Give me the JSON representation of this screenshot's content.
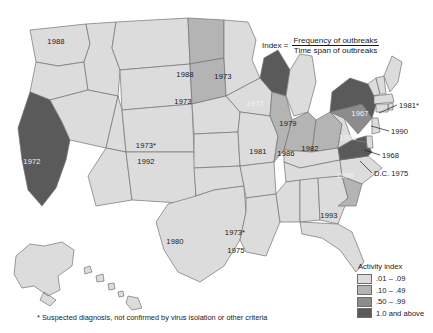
{
  "formula": {
    "label": "Index =",
    "numerator": "Frequency of outbreaks",
    "denominator": "Time span of outbreaks"
  },
  "legend": {
    "title": "Activity index",
    "items": [
      {
        "label": ".01 – .09",
        "color": "#dcdcdc"
      },
      {
        "label": ".10 – .49",
        "color": "#b4b4b4"
      },
      {
        "label": ".50 – .99",
        "color": "#8c8c8c"
      },
      {
        "label": "1.0 and above",
        "color": "#5a5a5a"
      }
    ]
  },
  "footnote": "* Suspected diagnosis, not confirmed by virus isolation or other criteria",
  "state_labels": [
    {
      "state": "washington",
      "text": "1988",
      "x": 56,
      "y": 41,
      "tone": "onlight"
    },
    {
      "state": "california",
      "text": "1972",
      "x": 32,
      "y": 161,
      "tone": "ondark"
    },
    {
      "state": "north-dakota",
      "text": "1988",
      "x": 185,
      "y": 74,
      "tone": "onlight"
    },
    {
      "state": "south-dakota",
      "text": "1973",
      "x": 183,
      "y": 101,
      "tone": "onlight"
    },
    {
      "state": "minnesota",
      "text": "1973",
      "x": 223,
      "y": 76,
      "tone": "onlight"
    },
    {
      "state": "wisconsin",
      "text": "1973",
      "x": 255,
      "y": 103,
      "tone": "ondark"
    },
    {
      "state": "colorado-suspected",
      "text": "1973*",
      "x": 146,
      "y": 145,
      "tone": "onlight"
    },
    {
      "state": "colorado",
      "text": "1992",
      "x": 146,
      "y": 161,
      "tone": "onlight"
    },
    {
      "state": "michigan",
      "text": "1979",
      "x": 288,
      "y": 123,
      "tone": "onlight"
    },
    {
      "state": "illinois",
      "text": "1981",
      "x": 258,
      "y": 151,
      "tone": "onlight"
    },
    {
      "state": "indiana",
      "text": "1986",
      "x": 286,
      "y": 153,
      "tone": "onlight"
    },
    {
      "state": "ohio",
      "text": "1982",
      "x": 310,
      "y": 148,
      "tone": "onlight"
    },
    {
      "state": "new-york",
      "text": "1967",
      "x": 360,
      "y": 113,
      "tone": "ondark"
    },
    {
      "state": "pennsylvania",
      "text": "1968",
      "x": 348,
      "y": 137,
      "tone": "ondark"
    },
    {
      "state": "virginia",
      "text": "1986",
      "x": 345,
      "y": 175,
      "tone": "ondark"
    },
    {
      "state": "texas",
      "text": "1980",
      "x": 175,
      "y": 241,
      "tone": "onlight"
    },
    {
      "state": "louisiana-suspected",
      "text": "1973*",
      "x": 235,
      "y": 232,
      "tone": "onlight"
    },
    {
      "state": "louisiana",
      "text": "1975",
      "x": 236,
      "y": 250,
      "tone": "onlight"
    },
    {
      "state": "south-carolina",
      "text": "1993",
      "x": 329,
      "y": 215,
      "tone": "onlight"
    }
  ],
  "callouts": [
    {
      "name": "rhode-island",
      "text": "1981*",
      "x": 399,
      "y": 105,
      "line": [
        397,
        105,
        379,
        113
      ]
    },
    {
      "name": "new-jersey",
      "text": "1990",
      "x": 391,
      "y": 131,
      "line": [
        389,
        131,
        371,
        126
      ]
    },
    {
      "name": "delaware",
      "text": "1968",
      "x": 382,
      "y": 155,
      "line": [
        380,
        155,
        364,
        150
      ]
    },
    {
      "name": "district-of-columbia",
      "text": "D.C. 1975",
      "x": 374,
      "y": 173,
      "line": [
        372,
        173,
        360,
        161
      ]
    }
  ]
}
